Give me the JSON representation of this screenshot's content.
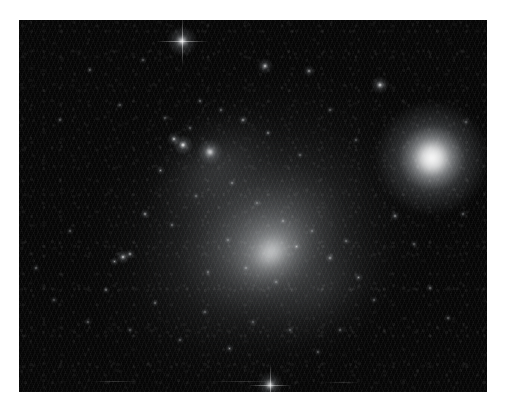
{
  "page": {
    "width": 505,
    "height": 417,
    "background_color": "#ffffff",
    "kind": "astronomical-image"
  },
  "plate": {
    "x": 19,
    "y": 20,
    "width": 468,
    "height": 372,
    "sky_color": "#050505",
    "border_color": "#ffffff",
    "caption": ""
  },
  "scene": {
    "title": "Irregular dwarf galaxy field",
    "galaxy_name": "",
    "notes": "monochrome broadband exposure"
  },
  "chart_data": {
    "type": "scatter",
    "title": "Irregular dwarf galaxy field",
    "xlabel": "",
    "ylabel": "",
    "xlim": [
      19,
      487
    ],
    "ylim": [
      20,
      392
    ],
    "grid": false,
    "legend": null,
    "galaxy_halo": [
      {
        "name": "outer-envelope",
        "cx": 258,
        "cy": 232,
        "rx": 175,
        "ry": 150,
        "rot": -32,
        "peak_alpha": 0.16,
        "color": "#b9c0c6"
      },
      {
        "name": "mid-envelope",
        "cx": 262,
        "cy": 238,
        "rx": 128,
        "ry": 104,
        "rot": -32,
        "peak_alpha": 0.22,
        "color": "#c6ccd2"
      },
      {
        "name": "inner-envelope",
        "cx": 268,
        "cy": 246,
        "rx": 88,
        "ry": 70,
        "rot": -34,
        "peak_alpha": 0.28,
        "color": "#d2d7dc"
      },
      {
        "name": "nw-arm-glow",
        "cx": 215,
        "cy": 168,
        "rx": 72,
        "ry": 52,
        "rot": -40,
        "peak_alpha": 0.17,
        "color": "#c0c6cc"
      },
      {
        "name": "se-tail-glow",
        "cx": 320,
        "cy": 290,
        "rx": 82,
        "ry": 54,
        "rot": -34,
        "peak_alpha": 0.13,
        "color": "#b4bac0"
      },
      {
        "name": "core-bright",
        "cx": 272,
        "cy": 253,
        "rx": 46,
        "ry": 38,
        "rot": -35,
        "peak_alpha": 0.4,
        "color": "#e4e8ea"
      },
      {
        "name": "core-nucleus",
        "cx": 271,
        "cy": 252,
        "rx": 22,
        "ry": 18,
        "rot": -35,
        "peak_alpha": 0.52,
        "color": "#f0f2f4"
      }
    ],
    "objects": [
      {
        "name": "globular-cluster",
        "x": 432,
        "y": 158,
        "r": 17,
        "brightness": 1.0,
        "type": "fuzzy-cluster",
        "spikes": false
      },
      {
        "name": "bright-star-top",
        "x": 182,
        "y": 41,
        "r": 5.0,
        "brightness": 0.98,
        "type": "star",
        "spikes": true
      },
      {
        "name": "bright-star-bottom",
        "x": 270,
        "y": 385,
        "r": 4.2,
        "brightness": 0.92,
        "type": "star",
        "spikes": true
      },
      {
        "name": "star-knot-a",
        "x": 210,
        "y": 152,
        "r": 4.4,
        "brightness": 0.95,
        "type": "star-cluster-knot",
        "spikes": false
      },
      {
        "name": "star-knot-b",
        "x": 183,
        "y": 145,
        "r": 3.4,
        "brightness": 0.88,
        "type": "star-cluster-knot",
        "spikes": false
      },
      {
        "name": "star-knot-c",
        "x": 174,
        "y": 139,
        "r": 2.2,
        "brightness": 0.72,
        "type": "star",
        "spikes": false
      },
      {
        "name": "star-upper-right",
        "x": 380,
        "y": 85,
        "r": 3.0,
        "brightness": 0.8,
        "type": "star",
        "spikes": false
      },
      {
        "name": "star-upper-mid-a",
        "x": 265,
        "y": 66,
        "r": 2.6,
        "brightness": 0.74,
        "type": "star",
        "spikes": false
      },
      {
        "name": "star-upper-mid-b",
        "x": 309,
        "y": 71,
        "r": 1.9,
        "brightness": 0.6,
        "type": "star",
        "spikes": false
      },
      {
        "name": "knot-west-a",
        "x": 123,
        "y": 257,
        "r": 2.4,
        "brightness": 0.78,
        "type": "star",
        "spikes": false
      },
      {
        "name": "knot-west-b",
        "x": 130,
        "y": 254,
        "r": 1.8,
        "brightness": 0.66,
        "type": "star",
        "spikes": false
      },
      {
        "name": "knot-west-c",
        "x": 114,
        "y": 261,
        "r": 1.5,
        "brightness": 0.58,
        "type": "star",
        "spikes": false
      },
      {
        "name": "star-field-01",
        "x": 243,
        "y": 120,
        "r": 1.7,
        "brightness": 0.62,
        "type": "star",
        "spikes": false
      },
      {
        "name": "star-field-02",
        "x": 268,
        "y": 133,
        "r": 1.4,
        "brightness": 0.55,
        "type": "star",
        "spikes": false
      },
      {
        "name": "star-field-03",
        "x": 200,
        "y": 101,
        "r": 1.3,
        "brightness": 0.52,
        "type": "star",
        "spikes": false
      },
      {
        "name": "star-field-04",
        "x": 221,
        "y": 110,
        "r": 1.2,
        "brightness": 0.48,
        "type": "star",
        "spikes": false
      },
      {
        "name": "star-field-05",
        "x": 160,
        "y": 170,
        "r": 1.5,
        "brightness": 0.57,
        "type": "star",
        "spikes": false
      },
      {
        "name": "star-field-06",
        "x": 145,
        "y": 214,
        "r": 1.6,
        "brightness": 0.6,
        "type": "star",
        "spikes": false
      },
      {
        "name": "star-field-07",
        "x": 172,
        "y": 225,
        "r": 1.3,
        "brightness": 0.5,
        "type": "star",
        "spikes": false
      },
      {
        "name": "star-field-08",
        "x": 196,
        "y": 196,
        "r": 1.2,
        "brightness": 0.47,
        "type": "star",
        "spikes": false
      },
      {
        "name": "star-field-09",
        "x": 232,
        "y": 183,
        "r": 1.4,
        "brightness": 0.54,
        "type": "star",
        "spikes": false
      },
      {
        "name": "star-field-10",
        "x": 257,
        "y": 203,
        "r": 1.2,
        "brightness": 0.48,
        "type": "star",
        "spikes": false
      },
      {
        "name": "star-field-11",
        "x": 283,
        "y": 221,
        "r": 1.3,
        "brightness": 0.51,
        "type": "star",
        "spikes": false
      },
      {
        "name": "star-field-12",
        "x": 296,
        "y": 246,
        "r": 1.5,
        "brightness": 0.56,
        "type": "star",
        "spikes": false
      },
      {
        "name": "star-field-13",
        "x": 312,
        "y": 231,
        "r": 1.2,
        "brightness": 0.47,
        "type": "star",
        "spikes": false
      },
      {
        "name": "star-field-14",
        "x": 330,
        "y": 258,
        "r": 1.6,
        "brightness": 0.6,
        "type": "star",
        "spikes": false
      },
      {
        "name": "star-field-15",
        "x": 346,
        "y": 241,
        "r": 1.3,
        "brightness": 0.5,
        "type": "star",
        "spikes": false
      },
      {
        "name": "star-field-16",
        "x": 358,
        "y": 277,
        "r": 1.5,
        "brightness": 0.55,
        "type": "star",
        "spikes": false
      },
      {
        "name": "star-field-17",
        "x": 374,
        "y": 300,
        "r": 1.2,
        "brightness": 0.46,
        "type": "star",
        "spikes": false
      },
      {
        "name": "star-field-18",
        "x": 395,
        "y": 216,
        "r": 1.6,
        "brightness": 0.58,
        "type": "star",
        "spikes": false
      },
      {
        "name": "star-field-19",
        "x": 414,
        "y": 244,
        "r": 1.3,
        "brightness": 0.49,
        "type": "star",
        "spikes": false
      },
      {
        "name": "star-field-20",
        "x": 430,
        "y": 288,
        "r": 1.4,
        "brightness": 0.52,
        "type": "star",
        "spikes": false
      },
      {
        "name": "star-field-21",
        "x": 448,
        "y": 318,
        "r": 1.2,
        "brightness": 0.46,
        "type": "star",
        "spikes": false
      },
      {
        "name": "star-field-22",
        "x": 463,
        "y": 214,
        "r": 1.3,
        "brightness": 0.48,
        "type": "star",
        "spikes": false
      },
      {
        "name": "star-field-23",
        "x": 466,
        "y": 122,
        "r": 1.2,
        "brightness": 0.45,
        "type": "star",
        "spikes": false
      },
      {
        "name": "star-field-24",
        "x": 36,
        "y": 268,
        "r": 1.4,
        "brightness": 0.5,
        "type": "star",
        "spikes": false
      },
      {
        "name": "star-field-25",
        "x": 54,
        "y": 300,
        "r": 1.2,
        "brightness": 0.44,
        "type": "star",
        "spikes": false
      },
      {
        "name": "star-field-26",
        "x": 70,
        "y": 231,
        "r": 1.3,
        "brightness": 0.47,
        "type": "star",
        "spikes": false
      },
      {
        "name": "star-field-27",
        "x": 88,
        "y": 322,
        "r": 1.2,
        "brightness": 0.45,
        "type": "star",
        "spikes": false
      },
      {
        "name": "star-field-28",
        "x": 106,
        "y": 290,
        "r": 1.3,
        "brightness": 0.48,
        "type": "star",
        "spikes": false
      },
      {
        "name": "star-field-29",
        "x": 130,
        "y": 330,
        "r": 1.2,
        "brightness": 0.44,
        "type": "star",
        "spikes": false
      },
      {
        "name": "star-field-30",
        "x": 155,
        "y": 303,
        "r": 1.4,
        "brightness": 0.5,
        "type": "star",
        "spikes": false
      },
      {
        "name": "star-field-31",
        "x": 180,
        "y": 340,
        "r": 1.2,
        "brightness": 0.45,
        "type": "star",
        "spikes": false
      },
      {
        "name": "star-field-32",
        "x": 205,
        "y": 312,
        "r": 1.3,
        "brightness": 0.48,
        "type": "star",
        "spikes": false
      },
      {
        "name": "star-field-33",
        "x": 229,
        "y": 348,
        "r": 1.5,
        "brightness": 0.54,
        "type": "star",
        "spikes": false
      },
      {
        "name": "star-field-34",
        "x": 253,
        "y": 322,
        "r": 1.2,
        "brightness": 0.45,
        "type": "star",
        "spikes": false
      },
      {
        "name": "star-field-35",
        "x": 290,
        "y": 330,
        "r": 1.3,
        "brightness": 0.47,
        "type": "star",
        "spikes": false
      },
      {
        "name": "star-field-36",
        "x": 318,
        "y": 352,
        "r": 1.2,
        "brightness": 0.44,
        "type": "star",
        "spikes": false
      },
      {
        "name": "star-field-37",
        "x": 340,
        "y": 330,
        "r": 1.3,
        "brightness": 0.46,
        "type": "star",
        "spikes": false
      },
      {
        "name": "star-field-38",
        "x": 60,
        "y": 120,
        "r": 1.2,
        "brightness": 0.42,
        "type": "star",
        "spikes": false
      },
      {
        "name": "star-field-39",
        "x": 90,
        "y": 70,
        "r": 1.2,
        "brightness": 0.42,
        "type": "star",
        "spikes": false
      },
      {
        "name": "star-field-40",
        "x": 120,
        "y": 105,
        "r": 1.2,
        "brightness": 0.43,
        "type": "star",
        "spikes": false
      },
      {
        "name": "star-field-41",
        "x": 143,
        "y": 60,
        "r": 1.3,
        "brightness": 0.46,
        "type": "star",
        "spikes": false
      },
      {
        "name": "star-field-42",
        "x": 330,
        "y": 110,
        "r": 1.3,
        "brightness": 0.46,
        "type": "star",
        "spikes": false
      },
      {
        "name": "star-field-43",
        "x": 356,
        "y": 140,
        "r": 1.2,
        "brightness": 0.43,
        "type": "star",
        "spikes": false
      },
      {
        "name": "star-field-44",
        "x": 300,
        "y": 155,
        "r": 1.3,
        "brightness": 0.47,
        "type": "star",
        "spikes": false
      },
      {
        "name": "star-field-45",
        "x": 246,
        "y": 268,
        "r": 1.4,
        "brightness": 0.52,
        "type": "star",
        "spikes": false
      },
      {
        "name": "star-field-46",
        "x": 276,
        "y": 282,
        "r": 1.3,
        "brightness": 0.49,
        "type": "star",
        "spikes": false
      },
      {
        "name": "star-field-47",
        "x": 228,
        "y": 240,
        "r": 1.3,
        "brightness": 0.5,
        "type": "star",
        "spikes": false
      },
      {
        "name": "star-field-48",
        "x": 208,
        "y": 272,
        "r": 1.2,
        "brightness": 0.46,
        "type": "star",
        "spikes": false
      },
      {
        "name": "star-field-49",
        "x": 190,
        "y": 128,
        "r": 1.2,
        "brightness": 0.45,
        "type": "star",
        "spikes": false
      },
      {
        "name": "star-field-50",
        "x": 165,
        "y": 118,
        "r": 1.2,
        "brightness": 0.44,
        "type": "star",
        "spikes": false
      }
    ],
    "artifacts": [
      {
        "name": "readout-streak-1",
        "x": 92,
        "y": 381,
        "w": 46,
        "alpha": 0.16
      },
      {
        "name": "readout-streak-2",
        "x": 208,
        "y": 381,
        "w": 70,
        "alpha": 0.14
      },
      {
        "name": "readout-streak-3",
        "x": 322,
        "y": 382,
        "w": 40,
        "alpha": 0.13
      }
    ]
  }
}
